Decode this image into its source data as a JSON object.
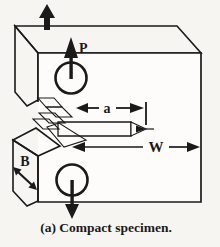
{
  "figure": {
    "caption": "(a) Compact specimen.",
    "labels": {
      "load": "P",
      "crack_length": "a",
      "width": "W",
      "thickness": "B"
    },
    "colors": {
      "ink": "#1a1a1a",
      "paper": "#f7f5f1",
      "face_base": "#f2f0ea",
      "face_dot": "#b2aea5",
      "hole_base": "#cdc9c0",
      "hole_dot": "#57534c",
      "front_face": "#fdfcfa"
    }
  }
}
